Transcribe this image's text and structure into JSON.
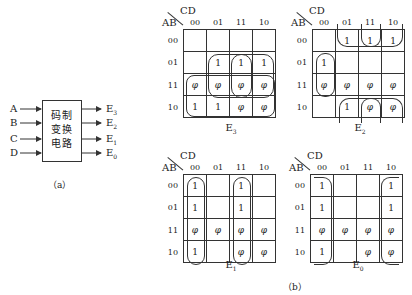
{
  "figure_a": {
    "inputs": [
      "A",
      "B",
      "C",
      "D"
    ],
    "block_lines": [
      "码制",
      "变换",
      "电路"
    ],
    "outputs": [
      "E3",
      "E2",
      "E1",
      "E0"
    ],
    "output_labels": [
      {
        "base": "E",
        "sub": "3"
      },
      {
        "base": "E",
        "sub": "2"
      },
      {
        "base": "E",
        "sub": "1"
      },
      {
        "base": "E",
        "sub": "0"
      }
    ],
    "caption": "（a）"
  },
  "figure_b": {
    "caption": "（b）",
    "col_var": "CD",
    "row_var": "AB",
    "col_labels": [
      "00",
      "01",
      "11",
      "10"
    ],
    "row_labels": [
      "00",
      "01",
      "11",
      "10"
    ],
    "maps": [
      {
        "name": "E3",
        "base": "E",
        "sub": "3",
        "cells": [
          [
            "",
            "",
            "",
            ""
          ],
          [
            "",
            "1",
            "1",
            "1"
          ],
          [
            "φ",
            "φ",
            "φ",
            "φ"
          ],
          [
            "1",
            "1",
            "φ",
            "φ"
          ]
        ]
      },
      {
        "name": "E2",
        "base": "E",
        "sub": "2",
        "cells": [
          [
            "",
            "1",
            "1",
            "1"
          ],
          [
            "1",
            "",
            "",
            ""
          ],
          [
            "φ",
            "φ",
            "φ",
            "φ"
          ],
          [
            "",
            "1",
            "φ",
            "φ"
          ]
        ]
      },
      {
        "name": "E1",
        "base": "E",
        "sub": "1",
        "cells": [
          [
            "1",
            "",
            "1",
            ""
          ],
          [
            "1",
            "",
            "1",
            ""
          ],
          [
            "φ",
            "φ",
            "φ",
            "φ"
          ],
          [
            "1",
            "",
            "φ",
            "φ"
          ]
        ]
      },
      {
        "name": "E0",
        "base": "E",
        "sub": "0",
        "cells": [
          [
            "1",
            "",
            "",
            "1"
          ],
          [
            "1",
            "",
            "",
            "1"
          ],
          [
            "φ",
            "φ",
            "φ",
            "φ"
          ],
          [
            "1",
            "",
            "φ",
            "φ"
          ]
        ]
      }
    ]
  }
}
